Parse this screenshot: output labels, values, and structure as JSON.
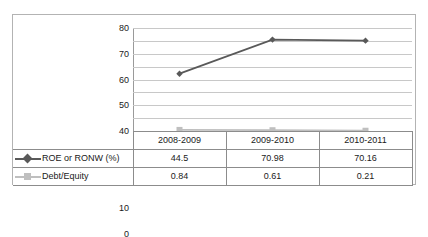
{
  "chart_data": {
    "type": "line",
    "title": "",
    "xlabel": "",
    "ylabel": "",
    "categories": [
      "2008-2009",
      "2009-2010",
      "2010-2011"
    ],
    "ylim": [
      0,
      80
    ],
    "yticks": [
      0,
      10,
      20,
      30,
      40,
      50,
      60,
      70,
      80
    ],
    "grid": true,
    "legend_position": "data-table-left",
    "series": [
      {
        "name": "ROE or RONW (%)",
        "values": [
          44.5,
          70.98,
          70.16
        ],
        "color": "#595959",
        "marker": "diamond"
      },
      {
        "name": "Debt/Equity",
        "values": [
          0.84,
          0.61,
          0.21
        ],
        "color": "#bfbfbf",
        "marker": "square"
      }
    ]
  },
  "table": {
    "row_label_header": "",
    "rows": [
      {
        "label": "ROE or RONW (%)",
        "cells": [
          "44.5",
          "70.98",
          "70.16"
        ]
      },
      {
        "label": "Debt/Equity",
        "cells": [
          "0.84",
          "0.61",
          "0.21"
        ]
      }
    ]
  },
  "colors": {
    "series1": "#595959",
    "series2": "#bfbfbf",
    "gridline": "#c8c8c8",
    "border": "#b3b3b3",
    "table_border": "#8c8c8c"
  }
}
